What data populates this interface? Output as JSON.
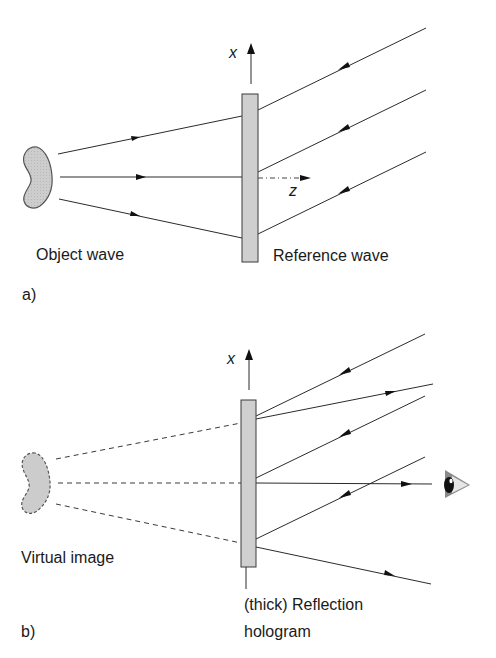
{
  "panel_a": {
    "tag": "a)",
    "object_label": "Object wave",
    "reference_label": "Reference wave",
    "axis_x": "x",
    "axis_z": "z"
  },
  "panel_b": {
    "tag": "b)",
    "virtual_label": "Virtual image",
    "hologram_label_line1": "(thick) Reflection",
    "hologram_label_line2": "hologram",
    "axis_x": "x"
  },
  "colors": {
    "plate_fill": "#cfcfcf",
    "object_fill": "#c8c8c8",
    "line": "#2b2b2b",
    "eye_iris": "#111111",
    "eye_lid": "#8a8a8a"
  },
  "icons": {
    "object": "kidney-shaped-object",
    "viewer": "eye-icon"
  }
}
